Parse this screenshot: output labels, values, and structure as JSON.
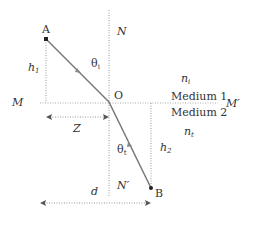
{
  "diagram": {
    "type": "refraction",
    "points": {
      "A": "A",
      "B": "B",
      "O": "O"
    },
    "axes": {
      "interface_left": "M",
      "interface_right": "M′",
      "normal_top": "N",
      "normal_bottom": "N′"
    },
    "media": {
      "medium1": "Medium 1",
      "medium2": "Medium 2",
      "n1_base": "n",
      "n1_sub": "i",
      "n2_base": "n",
      "n2_sub": "t"
    },
    "angles": {
      "incident_base": "θ",
      "incident_sub": "i",
      "transmitted_base": "θ",
      "transmitted_sub": "t"
    },
    "distances": {
      "h1_base": "h",
      "h1_sub": "1",
      "h2_base": "h",
      "h2_sub": "2",
      "z": "Z",
      "d": "d"
    },
    "colors": {
      "ray": "#777777",
      "dotted": "#999999",
      "text": "#333333"
    }
  }
}
